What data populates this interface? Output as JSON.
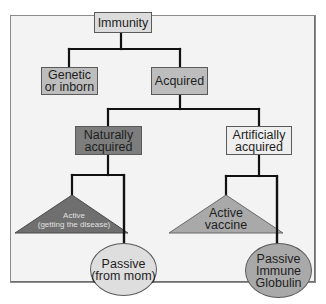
{
  "diagram": {
    "type": "tree",
    "colors": {
      "frame_bg": "#f3f3f3",
      "connector": "#111111",
      "immunity_box": "#dcdcdc",
      "genetic_box": "#bdbdbd",
      "acquired_box": "#bdbdbd",
      "naturally_box": "#7d7d7d",
      "artificially_box": "#eeeeee",
      "active_disease_triangle": "#6f6f6f",
      "active_vaccine_triangle": "#a9a9a9",
      "passive_mom_ellipse": "#dedede",
      "passive_globulin_ellipse": "#a9a9a9"
    },
    "nodes": {
      "immunity": {
        "label": "Immunity"
      },
      "genetic": {
        "label": "Genetic\nor inborn"
      },
      "acquired": {
        "label": "Acquired"
      },
      "naturally": {
        "label": "Naturally\nacquired"
      },
      "artificially": {
        "label": "Artificially\nacquired"
      },
      "active_disease": {
        "label": "Active\n(getting the disease)"
      },
      "passive_mom": {
        "label": "Passive\n(from mom)"
      },
      "active_vaccine": {
        "label": "Active\nvaccine"
      },
      "passive_globulin": {
        "label": "Passive\nImmune\nGlobulin"
      }
    },
    "edges": [
      [
        "Immunity",
        "Genetic or inborn"
      ],
      [
        "Immunity",
        "Acquired"
      ],
      [
        "Acquired",
        "Naturally acquired"
      ],
      [
        "Acquired",
        "Artificially acquired"
      ],
      [
        "Naturally acquired",
        "Active (getting the disease)"
      ],
      [
        "Naturally acquired",
        "Passive (from mom)"
      ],
      [
        "Artificially acquired",
        "Active vaccine"
      ],
      [
        "Artificially acquired",
        "Passive Immune Globulin"
      ]
    ]
  }
}
